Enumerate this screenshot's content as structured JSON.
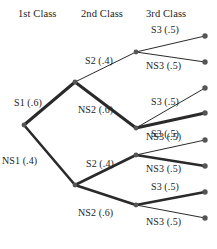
{
  "diagram": {
    "type": "probability-tree",
    "background_color": "#ffffff",
    "line_color": "#2a2a2a",
    "node_color": "#555555",
    "text_color": "#232323"
  },
  "headers": [
    {
      "label": "1st Class",
      "x": 18,
      "y": 8
    },
    {
      "label": "2nd Class",
      "x": 81,
      "y": 8
    },
    {
      "label": "3rd Class",
      "x": 146,
      "y": 8
    }
  ],
  "nodes": [
    {
      "id": "root",
      "x": 24,
      "y": 125,
      "level": 0
    },
    {
      "id": "s1",
      "x": 75,
      "y": 82,
      "level": 1
    },
    {
      "id": "ns1",
      "x": 75,
      "y": 185,
      "level": 1
    },
    {
      "id": "s1s2",
      "x": 136,
      "y": 52,
      "level": 2
    },
    {
      "id": "s1ns2",
      "x": 136,
      "y": 128,
      "level": 2
    },
    {
      "id": "ns1s2",
      "x": 136,
      "y": 155,
      "level": 2
    },
    {
      "id": "ns1ns2",
      "x": 136,
      "y": 205,
      "level": 2
    }
  ],
  "leaves": [
    {
      "id": "leaf1",
      "x": 205,
      "y": 36
    },
    {
      "id": "leaf2",
      "x": 205,
      "y": 62
    },
    {
      "id": "leaf3",
      "x": 205,
      "y": 88
    },
    {
      "id": "leaf4",
      "x": 205,
      "y": 113
    },
    {
      "id": "leaf5",
      "x": 205,
      "y": 140
    },
    {
      "id": "leaf6",
      "x": 205,
      "y": 166
    },
    {
      "id": "leaf7",
      "x": 205,
      "y": 192
    },
    {
      "id": "leaf8",
      "x": 205,
      "y": 218
    }
  ],
  "edges": [
    {
      "id": "e-s1",
      "from": "root",
      "to": "s1",
      "label": "S1 (.6)",
      "probability": 0.6,
      "weight": 3.0,
      "lx": 14,
      "ly": 97
    },
    {
      "id": "e-ns1",
      "from": "root",
      "to": "ns1",
      "label": "NS1 (.4)",
      "probability": 0.4,
      "weight": 2.6,
      "lx": 2,
      "ly": 155
    },
    {
      "id": "e-s1s2",
      "from": "s1",
      "to": "s1s2",
      "label": "S2 (.4)",
      "probability": 0.4,
      "weight": 1.0,
      "lx": 85,
      "ly": 55
    },
    {
      "id": "e-s1ns2",
      "from": "s1",
      "to": "s1ns2",
      "label": "NS2 (.6)",
      "probability": 0.6,
      "weight": 3.0,
      "lx": 78,
      "ly": 104
    },
    {
      "id": "e-ns1s2",
      "from": "ns1",
      "to": "ns1s2",
      "label": "S2 (.4)",
      "probability": 0.4,
      "weight": 2.6,
      "lx": 86,
      "ly": 158
    },
    {
      "id": "e-ns1ns2",
      "from": "ns1",
      "to": "ns1ns2",
      "label": "NS2 (.6)",
      "probability": 0.6,
      "weight": 2.6,
      "lx": 78,
      "ly": 207
    },
    {
      "id": "e-1",
      "from": "s1s2",
      "to": "leaf1",
      "label": "S3 (.5)",
      "probability": 0.5,
      "weight": 1.0,
      "lx": 151,
      "ly": 24
    },
    {
      "id": "e-2",
      "from": "s1s2",
      "to": "leaf2",
      "label": "NS3 (.5)",
      "probability": 0.5,
      "weight": 1.0,
      "lx": 146,
      "ly": 60
    },
    {
      "id": "e-3",
      "from": "s1ns2",
      "to": "leaf3",
      "label": "S3 (.5)",
      "probability": 0.5,
      "weight": 1.0,
      "lx": 151,
      "ly": 96
    },
    {
      "id": "e-4",
      "from": "s1ns2",
      "to": "leaf4",
      "label": "NS3 (.5)",
      "probability": 0.5,
      "weight": 3.0,
      "lx": 146,
      "ly": 131
    },
    {
      "id": "e-5",
      "from": "ns1s2",
      "to": "leaf5",
      "label": "S3 (.5)",
      "probability": 0.5,
      "weight": 1.0,
      "lx": 151,
      "ly": 128
    },
    {
      "id": "e-6",
      "from": "ns1s2",
      "to": "leaf6",
      "label": "NS3 (.5)",
      "probability": 0.5,
      "weight": 2.6,
      "lx": 146,
      "ly": 163
    },
    {
      "id": "e-7",
      "from": "ns1ns2",
      "to": "leaf7",
      "label": "S3 (.5)",
      "probability": 0.5,
      "weight": 2.6,
      "lx": 151,
      "ly": 181
    },
    {
      "id": "e-8",
      "from": "ns1ns2",
      "to": "leaf8",
      "label": "NS3 (.5)",
      "probability": 0.5,
      "weight": 1.0,
      "lx": 146,
      "ly": 216
    }
  ],
  "chart_data": {
    "type": "diagram",
    "levels": [
      "1st Class",
      "2nd Class",
      "3rd Class"
    ],
    "branch_probabilities": {
      "level1": {
        "S1": 0.6,
        "NS1": 0.4
      },
      "level2": {
        "S2": 0.4,
        "NS2": 0.6
      },
      "level3": {
        "S3": 0.5,
        "NS3": 0.5
      }
    },
    "paths": [
      {
        "sequence": [
          "S1 (.6)",
          "S2 (.4)",
          "S3 (.5)"
        ],
        "joint_probability": 0.12
      },
      {
        "sequence": [
          "S1 (.6)",
          "S2 (.4)",
          "NS3 (.5)"
        ],
        "joint_probability": 0.12
      },
      {
        "sequence": [
          "S1 (.6)",
          "NS2 (.6)",
          "S3 (.5)"
        ],
        "joint_probability": 0.18
      },
      {
        "sequence": [
          "S1 (.6)",
          "NS2 (.6)",
          "NS3 (.5)"
        ],
        "joint_probability": 0.18
      },
      {
        "sequence": [
          "NS1 (.4)",
          "S2 (.4)",
          "S3 (.5)"
        ],
        "joint_probability": 0.08
      },
      {
        "sequence": [
          "NS1 (.4)",
          "S2 (.4)",
          "NS3 (.5)"
        ],
        "joint_probability": 0.08
      },
      {
        "sequence": [
          "NS1 (.4)",
          "NS2 (.6)",
          "S3 (.5)"
        ],
        "joint_probability": 0.12
      },
      {
        "sequence": [
          "NS1 (.4)",
          "NS2 (.6)",
          "NS3 (.5)"
        ],
        "joint_probability": 0.12
      }
    ]
  }
}
